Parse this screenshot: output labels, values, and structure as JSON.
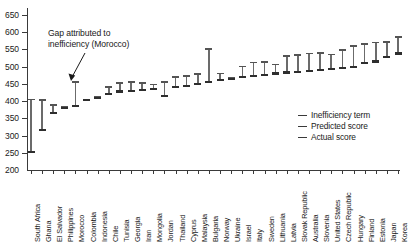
{
  "chart_data": {
    "type": "bar",
    "title": "",
    "subtitle": "",
    "xlabel": "",
    "ylabel": "",
    "ylim": [
      200,
      670
    ],
    "yticks": [
      250,
      300,
      350,
      400,
      450,
      500,
      550,
      600,
      650
    ],
    "grid": false,
    "legend_position": "bottom-right",
    "annotation": {
      "line1": "Gap attributed to",
      "line2": "inefficiency (Morocco)",
      "points_to": "Morocco"
    },
    "legend": [
      {
        "label": "Inefficiency term",
        "color": "#6b6b6b"
      },
      {
        "label": "Predicted score",
        "color": "#545454"
      },
      {
        "label": "Actual score",
        "color": "#2e2e2e"
      }
    ],
    "categories": [
      "South Africa",
      "Ghana",
      "El Salvador",
      "Philippines",
      "Morocco",
      "Colombia",
      "Indonesia",
      "Chile",
      "Tunisia",
      "Georgia",
      "Iran",
      "Mongolia",
      "Jordan",
      "Thailand",
      "Cyprus",
      "Malaysia",
      "Bulgaria",
      "Norway",
      "Ukraine",
      "Israel",
      "Italy",
      "Sweden",
      "Lithuania",
      "Latvia",
      "Slovak Republic",
      "Australia",
      "Slovenia",
      "United States",
      "Czech Republic",
      "Hungary",
      "Finland",
      "Estonia",
      "Japan",
      "Korea"
    ],
    "series": [
      {
        "name": "Actual score",
        "values": [
          253,
          316,
          365,
          379,
          386,
          403,
          410,
          421,
          428,
          430,
          432,
          434,
          415,
          440,
          443,
          450,
          456,
          462,
          463,
          470,
          473,
          477,
          480,
          483,
          485,
          487,
          491,
          494,
          497,
          500,
          510,
          515,
          528,
          538
        ]
      },
      {
        "name": "Predicted score",
        "values": [
          405,
          403,
          388,
          383,
          455,
          404,
          413,
          440,
          452,
          455,
          452,
          448,
          456,
          470,
          472,
          478,
          552,
          480,
          468,
          500,
          512,
          513,
          506,
          530,
          534,
          538,
          540,
          535,
          548,
          560,
          566,
          570,
          572,
          585
        ]
      }
    ],
    "inefficiency_gap_note": "Vertical bar spans from Actual score to Predicted score"
  }
}
